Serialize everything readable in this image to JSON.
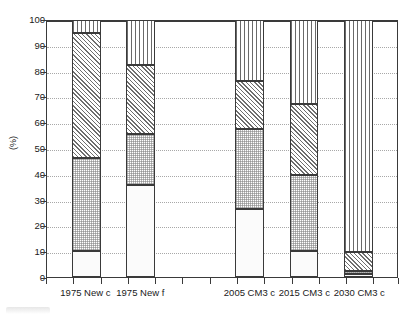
{
  "chart_data": {
    "type": "bar",
    "subtype": "stacked-100-percent",
    "title": "",
    "xlabel": "",
    "ylabel": "(%)",
    "ylim": [
      0,
      100
    ],
    "yticks": [
      0,
      10,
      20,
      30,
      40,
      50,
      60,
      70,
      80,
      90,
      100
    ],
    "ytick_labels": [
      "0",
      "10",
      "20",
      "30",
      "40",
      "50",
      "60",
      "70",
      "80",
      "90",
      "100"
    ],
    "grid": true,
    "legend": "none",
    "categories": [
      "1975 New c",
      "1975 New f",
      "2005 CM3 c",
      "2015 CM3 c",
      "2030 CM3 c"
    ],
    "series": [
      {
        "name": "segment-1-blank",
        "pattern": "blank",
        "values": [
          10.0,
          35.5,
          26.5,
          10.0,
          1.0
        ]
      },
      {
        "name": "segment-2-dots",
        "pattern": "dots",
        "values": [
          36.0,
          20.0,
          31.0,
          29.5,
          1.5
        ]
      },
      {
        "name": "segment-3-diagonal-hatch",
        "pattern": "diagonal-hatch",
        "values": [
          48.5,
          26.5,
          18.5,
          27.5,
          7.0
        ]
      },
      {
        "name": "segment-4-vertical-lines",
        "pattern": "vertical-lines",
        "values": [
          5.5,
          18.0,
          24.0,
          33.0,
          90.5
        ]
      }
    ],
    "cumulative_tops": {
      "1975 New c": [
        10.0,
        46.0,
        94.5,
        100.0
      ],
      "1975 New f": [
        35.5,
        55.5,
        82.0,
        100.0
      ],
      "2005 CM3 c": [
        26.5,
        57.5,
        76.0,
        100.0
      ],
      "2015 CM3 c": [
        10.0,
        39.5,
        67.0,
        100.0
      ],
      "2030 CM3 c": [
        1.0,
        2.5,
        9.5,
        100.0
      ]
    },
    "bar_layout": [
      {
        "category": "1975 New c",
        "left_pct": 7.1,
        "width_pct": 8.2
      },
      {
        "category": "1975 New f",
        "left_pct": 22.7,
        "width_pct": 8.2
      },
      {
        "category": "2005 CM3 c",
        "left_pct": 53.7,
        "width_pct": 8.2
      },
      {
        "category": "2015 CM3 c",
        "left_pct": 69.3,
        "width_pct": 8.2
      },
      {
        "category": "2030 CM3 c",
        "left_pct": 84.9,
        "width_pct": 8.2
      }
    ],
    "xtick_positions_pct": [
      0,
      7.75,
      15.5,
      23.25,
      31.0,
      38.75,
      46.5,
      54.25,
      62.0,
      69.75,
      77.5,
      85.25,
      93.0,
      100.0
    ],
    "colors": {
      "axis": "#3a3a3a",
      "grid": "#a8a8a8",
      "pattern_ink": "#6e6e6e",
      "background": "#ffffff"
    }
  }
}
